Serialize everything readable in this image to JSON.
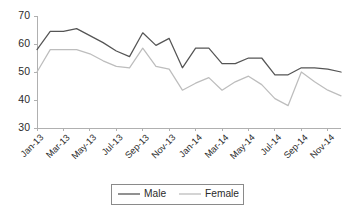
{
  "chart_data": {
    "type": "line",
    "title": "",
    "subtitle": "",
    "xlabel": "",
    "ylabel": "",
    "ylim": [
      30,
      70
    ],
    "yticks": [
      30,
      40,
      50,
      60,
      70
    ],
    "ytick_labels": [
      "30",
      "40",
      "50",
      "60",
      "70"
    ],
    "grid": false,
    "legend_position": "bottom-center",
    "x": [
      "Jan-13",
      "Feb-13",
      "Mar-13",
      "Apr-13",
      "May-13",
      "Jun-13",
      "Jul-13",
      "Aug-13",
      "Sep-13",
      "Oct-13",
      "Nov-13",
      "Dec-13",
      "Jan-14",
      "Feb-14",
      "Mar-14",
      "Apr-14",
      "May-14",
      "Jun-14",
      "Jul-14",
      "Aug-14",
      "Sep-14",
      "Oct-14",
      "Nov-14",
      "Dec-14"
    ],
    "xtick_labels": [
      "Jan-13",
      "Mar-13",
      "May-13",
      "Jul-13",
      "Sep-13",
      "Nov-13",
      "Jan-14",
      "Mar-14",
      "May-14",
      "Jul-14",
      "Sep-14",
      "Nov-14"
    ],
    "series": [
      {
        "name": "Male",
        "color": "#555555",
        "values": [
          58.0,
          64.5,
          64.5,
          65.5,
          63.0,
          60.5,
          57.5,
          55.5,
          64.0,
          59.5,
          62.0,
          51.5,
          58.5,
          58.5,
          53.0,
          53.0,
          55.0,
          55.0,
          49.0,
          49.0,
          51.5,
          51.5,
          51.0,
          50.0
        ]
      },
      {
        "name": "Female",
        "color": "#bdbdbd",
        "values": [
          50.0,
          58.0,
          58.0,
          58.0,
          56.5,
          54.0,
          52.0,
          51.5,
          58.5,
          52.0,
          51.0,
          43.5,
          46.0,
          48.0,
          43.5,
          46.5,
          48.5,
          45.5,
          40.5,
          38.0,
          50.0,
          46.5,
          43.5,
          41.5
        ]
      }
    ]
  },
  "legend": {
    "items": [
      {
        "label": "Male"
      },
      {
        "label": "Female"
      }
    ]
  }
}
